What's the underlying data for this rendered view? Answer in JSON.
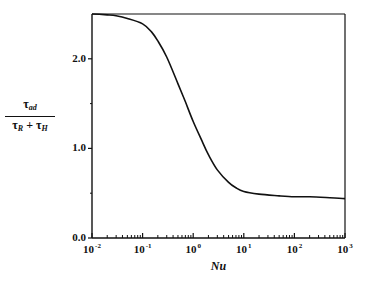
{
  "chart_data": {
    "type": "line",
    "title": "",
    "xlabel": "Nu",
    "ylabel": {
      "numerator": "τ",
      "numerator_sub": "ad",
      "denominator_a": "τ",
      "denominator_a_sub": "R",
      "plus": "+",
      "denominator_b": "τ",
      "denominator_b_sub": "H"
    },
    "xscale": "log",
    "xlim": [
      0.01,
      1000
    ],
    "ylim": [
      0.0,
      2.5
    ],
    "grid": false,
    "legend": null,
    "x_ticks": [
      {
        "base": "10",
        "exp": "-2",
        "value": 0.01
      },
      {
        "base": "10",
        "exp": "-1",
        "value": 0.1
      },
      {
        "base": "10",
        "exp": "0",
        "value": 1
      },
      {
        "base": "10",
        "exp": "1",
        "value": 10
      },
      {
        "base": "10",
        "exp": "2",
        "value": 100
      },
      {
        "base": "10",
        "exp": "3",
        "value": 1000
      }
    ],
    "y_ticks": [
      {
        "label": "0.0",
        "value": 0.0
      },
      {
        "label": "1.0",
        "value": 1.0
      },
      {
        "label": "2.0",
        "value": 2.0
      }
    ],
    "y_minor_ticks": [
      0.5,
      1.5
    ],
    "reference_line": {
      "y": 2.5,
      "description": "horizontal line at upper asymptote"
    },
    "series": [
      {
        "name": "tau_ad/(tau_R+tau_H)",
        "x": [
          0.01,
          0.02,
          0.03,
          0.05,
          0.1,
          0.15,
          0.2,
          0.3,
          0.5,
          0.7,
          1.0,
          1.5,
          2.0,
          3.0,
          5.0,
          7.0,
          10,
          20,
          50,
          100,
          200,
          500,
          1000
        ],
        "y": [
          2.5,
          2.49,
          2.48,
          2.45,
          2.39,
          2.3,
          2.2,
          2.02,
          1.72,
          1.52,
          1.3,
          1.08,
          0.93,
          0.76,
          0.62,
          0.56,
          0.52,
          0.49,
          0.47,
          0.46,
          0.46,
          0.45,
          0.44
        ]
      }
    ],
    "colors": {
      "line": "#111111",
      "axes": "#111111",
      "background": "#ffffff"
    }
  }
}
